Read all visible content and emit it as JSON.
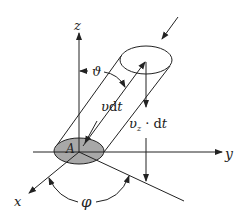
{
  "diagram": {
    "type": "physics-flux-cylinder",
    "colors": {
      "stroke": "#222222",
      "area_fill": "#a8a8a8"
    },
    "axes": {
      "x": "x",
      "y": "y",
      "z": "z"
    },
    "labels": {
      "area": "A",
      "polar_angle": "ϑ",
      "azimuth_angle": "φ",
      "slant_length_v": "υ",
      "slant_length_rest": "dt",
      "vertical_v": "υ",
      "vertical_sub": "z",
      "vertical_rest": " · dt"
    }
  }
}
